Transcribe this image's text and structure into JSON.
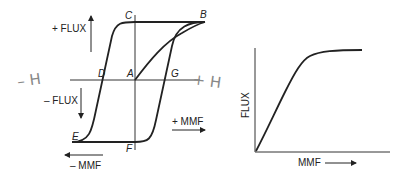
{
  "left_diagram": {
    "title": "Hysteresis loop",
    "labels": {
      "plus_flux": "+ FLUX",
      "minus_flux": "– FLUX",
      "plus_mmf": "+ MMF",
      "minus_mmf": "– MMF"
    },
    "points": {
      "A": "A",
      "B": "B",
      "C": "C",
      "D": "D",
      "E": "E",
      "F": "F",
      "G": "G"
    },
    "handwritten": {
      "minus_h": "– H",
      "plus_h": "+ H"
    }
  },
  "right_diagram": {
    "title": "Magnetization curve",
    "ylabel": "FLUX",
    "xlabel": "MMF"
  }
}
